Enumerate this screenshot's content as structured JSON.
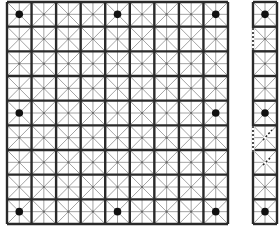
{
  "diagram": {
    "type": "go-board-grid",
    "main_board": {
      "columns": 9,
      "rows": 9,
      "x": 7,
      "y": 2,
      "width": 221,
      "height": 222,
      "star_points": [
        [
          0,
          0
        ],
        [
          4,
          0
        ],
        [
          8,
          0
        ],
        [
          0,
          4
        ],
        [
          8,
          4
        ],
        [
          0,
          8
        ],
        [
          4,
          8
        ],
        [
          8,
          8
        ]
      ]
    },
    "side_panel": {
      "columns": 1,
      "rows": 9,
      "x": 253,
      "y": 2,
      "width": 24,
      "height": 222,
      "star_points": [
        [
          0,
          0
        ],
        [
          0,
          4
        ],
        [
          0,
          8
        ]
      ],
      "dashed_segments": [
        {
          "x1": 253,
          "y1": 28,
          "x2": 253,
          "y2": 50
        },
        {
          "x1": 253,
          "y1": 126,
          "x2": 253,
          "y2": 152
        },
        {
          "x1": 263,
          "y1": 140,
          "x2": 272,
          "y2": 130
        },
        {
          "x1": 263,
          "y1": 165,
          "x2": 270,
          "y2": 158
        }
      ]
    },
    "colors": {
      "heavy_line": "#2a2a2a",
      "light_line": "#8a8a8a",
      "star_point": "#111111",
      "background": "#ffffff"
    }
  }
}
